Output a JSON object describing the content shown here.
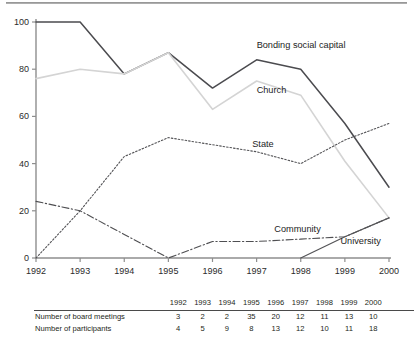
{
  "chart_data": {
    "type": "line",
    "title": "",
    "xlabel": "",
    "ylabel": "",
    "x": [
      1992,
      1993,
      1994,
      1995,
      1996,
      1997,
      1998,
      1999,
      2000
    ],
    "xticklabels": [
      "1992",
      "1993",
      "1994",
      "1995",
      "1996",
      "1997",
      "1998",
      "1999",
      "2000"
    ],
    "yticklabels": [
      "0",
      "20",
      "40",
      "60",
      "80",
      "100"
    ],
    "yticks": [
      0,
      20,
      40,
      60,
      80,
      100
    ],
    "ylim": [
      0,
      100
    ],
    "xlim": [
      1992,
      2000
    ],
    "grid": false,
    "legend_position": "inline-annotations",
    "series": [
      {
        "name": "Bonding social capital",
        "style": "solid-dark",
        "color": "#4b4b4f",
        "x": [
          1992,
          1993,
          1994,
          1995,
          1996,
          1997,
          1998,
          1999,
          2000
        ],
        "values": [
          100,
          100,
          78,
          87,
          72,
          84,
          80,
          57,
          30
        ]
      },
      {
        "name": "Church",
        "style": "solid-light",
        "color": "#d4d4d4",
        "x": [
          1992,
          1993,
          1994,
          1995,
          1996,
          1997,
          1998,
          1999,
          2000
        ],
        "values": [
          76,
          80,
          78,
          87,
          63,
          75,
          69,
          41,
          17
        ]
      },
      {
        "name": "State",
        "style": "dotted",
        "color": "#555558",
        "x": [
          1992,
          1993,
          1994,
          1995,
          1996,
          1997,
          1998,
          1999,
          2000
        ],
        "values": [
          0,
          20,
          43,
          51,
          48,
          45,
          40,
          50,
          57
        ]
      },
      {
        "name": "Community",
        "style": "dash-dot",
        "color": "#4f4f52",
        "x": [
          1992,
          1993,
          1994,
          1995,
          1996,
          1997,
          1998,
          1999,
          2000
        ],
        "values": [
          24,
          20,
          10,
          0,
          7,
          7,
          8,
          9,
          17
        ]
      },
      {
        "name": "University",
        "style": "solid-thin",
        "color": "#545457",
        "x": [
          1998,
          1999,
          2000
        ],
        "values": [
          0,
          9,
          17
        ]
      }
    ],
    "annotations": [
      {
        "text": "Bonding social capital",
        "x": 1997.0,
        "y": 89
      },
      {
        "text": "Church",
        "x": 1997.0,
        "y": 70
      },
      {
        "text": "State",
        "x": 1996.9,
        "y": 47
      },
      {
        "text": "Community",
        "x": 1997.4,
        "y": 11
      },
      {
        "text": "University",
        "x": 1998.9,
        "y": 6
      }
    ]
  },
  "table": {
    "columns": [
      "",
      "1992",
      "1993",
      "1994",
      "1995",
      "1996",
      "1997",
      "1998",
      "1999",
      "2000"
    ],
    "rows": [
      {
        "label": "Number of board meetings",
        "values": [
          "3",
          "2",
          "2",
          "35",
          "20",
          "12",
          "11",
          "13",
          "10"
        ]
      },
      {
        "label": "Number of participants",
        "values": [
          "4",
          "5",
          "9",
          "8",
          "13",
          "12",
          "10",
          "11",
          "18"
        ]
      }
    ]
  }
}
